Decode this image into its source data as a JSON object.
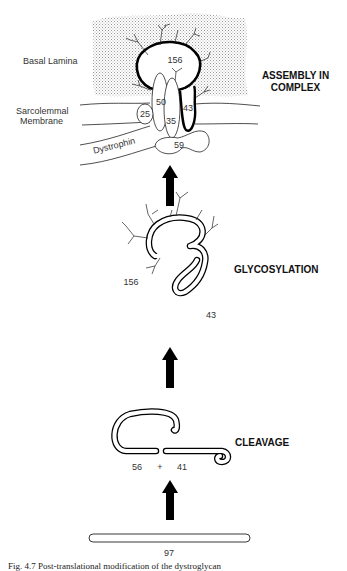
{
  "stages": [
    {
      "id": "assembly",
      "label_line1": "ASSEMBLY IN",
      "label_line2": "COMPLEX"
    },
    {
      "id": "glycosylation",
      "label": "GLYCOSYLATION"
    },
    {
      "id": "cleavage",
      "label": "CLEAVAGE"
    }
  ],
  "assembly": {
    "labels": {
      "basal_lamina": "Basal Lamina",
      "membrane_line1": "Sarcolemmal",
      "membrane_line2": "Membrane",
      "dystrophin": "Dystrophin"
    },
    "proteins": {
      "p156": "156",
      "p50": "50",
      "p43": "43",
      "p25": "25",
      "p35": "35",
      "p59": "59"
    }
  },
  "glycosylation": {
    "p156": "156",
    "p43": "43"
  },
  "cleavage": {
    "p56": "56",
    "plus": "+",
    "p41": "41"
  },
  "precursor": {
    "p97": "97"
  },
  "caption": "Fig. 4.7 Post-translational modification of the dystroglycan"
}
